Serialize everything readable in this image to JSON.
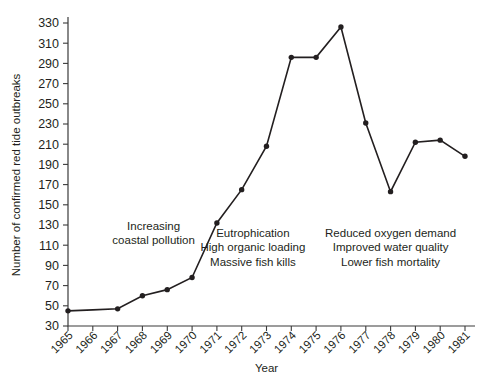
{
  "chart_data": {
    "type": "line",
    "title": "",
    "xlabel": "Year",
    "ylabel": "Number of confirmed red tide outbreaks",
    "categories": [
      1965,
      1966,
      1967,
      1968,
      1969,
      1970,
      1971,
      1972,
      1973,
      1974,
      1975,
      1976,
      1977,
      1978,
      1979,
      1980,
      1981
    ],
    "x_tick_labels": [
      "1965",
      "1966",
      "1967",
      "1968",
      "1969",
      "1970",
      "1971",
      "1972",
      "1973",
      "1974",
      "1975",
      "1976",
      "1977",
      "1978",
      "1979",
      "1980",
      "1981"
    ],
    "values": [
      45,
      46,
      47,
      60,
      66,
      78,
      132,
      165,
      208,
      296,
      296,
      326,
      231,
      163,
      212,
      214,
      198
    ],
    "marker_flags": [
      true,
      false,
      true,
      true,
      true,
      true,
      true,
      true,
      true,
      true,
      true,
      true,
      true,
      true,
      true,
      true,
      true
    ],
    "y_tick_labels": [
      "330",
      "310",
      "290",
      "270",
      "250",
      "230",
      "210",
      "190",
      "170",
      "150",
      "130",
      "110",
      "90",
      "70",
      "50",
      "30"
    ],
    "y_ticks": [
      330,
      310,
      290,
      270,
      250,
      230,
      210,
      190,
      170,
      150,
      130,
      110,
      90,
      70,
      50,
      30
    ],
    "ylim": [
      30,
      330
    ],
    "xlim": [
      1965,
      1981
    ],
    "grid": false,
    "legend": "none",
    "line_color": "#231f20",
    "marker_color": "#231f20",
    "axis_color": "#3b3b3b",
    "background_color": "#ffffff",
    "annotations": [
      {
        "name": "increasing-coastal-pollution",
        "lines": [
          "Increasing",
          "coastal pollution"
        ],
        "x_center_year": 1968.45,
        "y_center_value": 118
      },
      {
        "name": "eutrophication-note",
        "lines": [
          "Eutrophication",
          "High organic loading",
          "Massive fish kills"
        ],
        "x_center_year": 1972.45,
        "y_center_value": 104
      },
      {
        "name": "reduced-oxygen-demand-note",
        "lines": [
          "Reduced oxygen demand",
          "Improved water quality",
          "Lower fish mortality"
        ],
        "x_center_year": 1978.0,
        "y_center_value": 104
      }
    ]
  }
}
